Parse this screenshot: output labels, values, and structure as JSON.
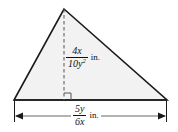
{
  "figure": {
    "kind": "geometry-diagram",
    "shape": "triangle",
    "colors": {
      "background": "#ffffff",
      "fill": "#f2f2f2",
      "stroke": "#1a1a1a",
      "dashed_stroke": "#555555",
      "text": "#111111"
    },
    "geometry": {
      "apex": {
        "x": 64,
        "y": 9
      },
      "bottom_left": {
        "x": 14,
        "y": 100
      },
      "bottom_right": {
        "x": 167,
        "y": 100
      },
      "altitude_foot": {
        "x": 64,
        "y": 100
      },
      "dimension_line_y": 116,
      "right_angle_marker": {
        "x": 64,
        "y": 100,
        "size": 7,
        "side": "right"
      }
    },
    "height_label": {
      "name": "height",
      "numerator": "4x",
      "denominator": "10y",
      "denominator_exponent": "2",
      "units": "in.",
      "plain_text": "4x/10y^2 in."
    },
    "base_label": {
      "name": "base",
      "numerator": "5y",
      "denominator": "6x",
      "denominator_exponent": "",
      "units": "in.",
      "plain_text": "5y/6x in."
    }
  }
}
